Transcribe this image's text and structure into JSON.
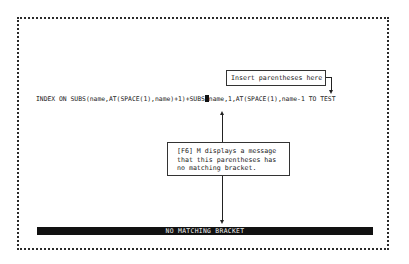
{
  "screen": {
    "command_line": {
      "before_cursor": "INDEX ON SUBS(name,AT(SPACE(1),name)+1)+SUBS",
      "after_cursor": "name,1,AT(SPACE(1),name-1 TO TEST"
    },
    "callouts": {
      "insert_hint": "Insert parentheses here",
      "message_hint": "[F6] M displays a message\nthat this parentheses has\nno matching bracket."
    },
    "status_bar": "NO MATCHING BRACKET"
  }
}
